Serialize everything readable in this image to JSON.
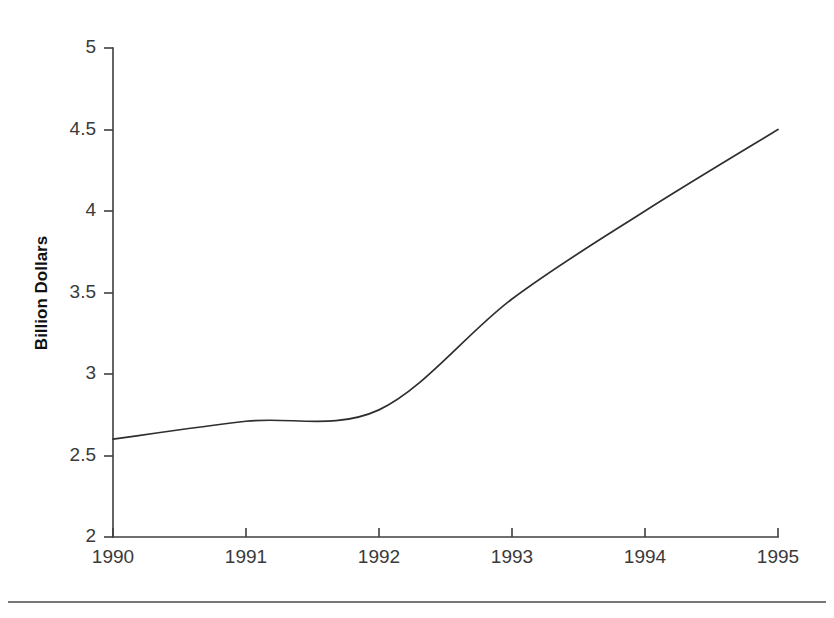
{
  "chart_data": {
    "type": "line",
    "title": "",
    "subtitle": "",
    "xlabel": "",
    "ylabel": "Billion Dollars",
    "x": [
      1990,
      1991,
      1992,
      1993,
      1994,
      1995
    ],
    "categories": [
      "1990",
      "1991",
      "1992",
      "1993",
      "1994",
      "1995"
    ],
    "values": [
      2.6,
      2.71,
      2.78,
      3.46,
      4.0,
      4.5
    ],
    "series": [
      {
        "name": "Billion Dollars",
        "values": [
          2.6,
          2.71,
          2.78,
          3.46,
          4.0,
          4.5
        ]
      }
    ],
    "xlim": [
      1990,
      1995
    ],
    "ylim": [
      2,
      5
    ],
    "yticks": [
      2,
      2.5,
      3,
      3.5,
      4,
      4.5,
      5
    ],
    "ytick_labels": [
      "2",
      "2.5",
      "3",
      "3.5",
      "4",
      "4.5",
      "5"
    ],
    "xticks": [
      1990,
      1991,
      1992,
      1993,
      1994,
      1995
    ],
    "xtick_labels": [
      "1990",
      "1991",
      "1992",
      "1993",
      "1994",
      "1995"
    ],
    "grid": false,
    "legend": false,
    "legend_position": "none",
    "line_color": "#2e2e33",
    "smoothing": "spline",
    "annotations": []
  },
  "axis": {
    "ytick_labels": [
      "5",
      "4.5",
      "4",
      "3.5",
      "3",
      "2.5",
      "2"
    ],
    "xtick_labels": [
      "1990",
      "1991",
      "1992",
      "1993",
      "1994",
      "1995"
    ],
    "y_axis_title": "Billion Dollars"
  }
}
